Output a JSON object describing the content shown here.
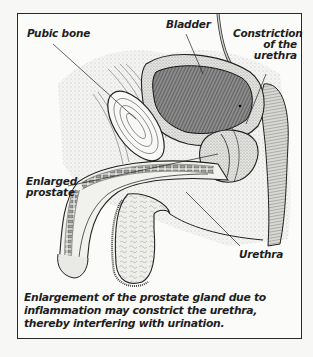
{
  "figure": {
    "labels": {
      "pubic_bone": "Pubic bone",
      "bladder": "Bladder",
      "constriction": [
        "Constriction",
        "of the",
        "urethra"
      ],
      "enlarged_prostate": [
        "Enlarged",
        "prostate"
      ],
      "urethra": "Urethra"
    },
    "caption": "Enlargement of the prostate gland due to inflammation may constrict the urethra, thereby interfering with urination.",
    "colors": {
      "ink": "#1e1e1e",
      "frame": "#2a2a2a",
      "background": "#f7f7f5",
      "stipple": "#9a9a9a",
      "bladder_fill": "#6e6e6e"
    }
  }
}
